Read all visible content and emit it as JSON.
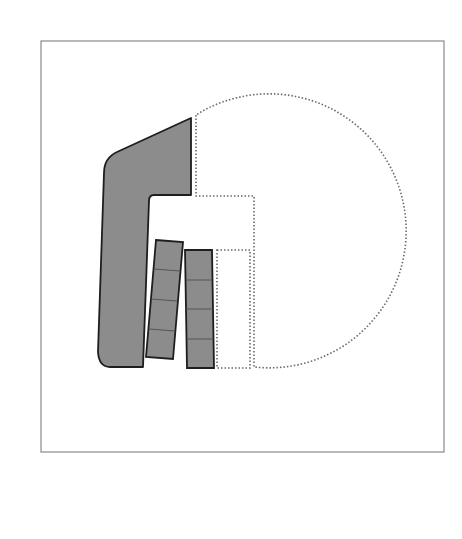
{
  "diagram": {
    "title": "",
    "colors": {
      "background": "#ffffff",
      "frame": "#8a8a8a",
      "fill": "#8c8c8c",
      "outline": "#1e1e1e",
      "divider": "#555555",
      "dotted": "#6a6a6a"
    },
    "frame": {
      "x": 41,
      "y": 41,
      "width": 403,
      "height": 411
    },
    "main_building": {
      "label": "L-shaped building mass",
      "path": "M 191 118 L 191 195 L 154 195 Q 149 195 149 201 L 143 367 L 110 367 Q 99 367 98 352 L 104 173 Q 104 158 117 152 Z"
    },
    "bar_blocks": [
      {
        "label": "Tilted bar block",
        "points": "156,240 183,242 173,359 146,357",
        "dividers": [
          {
            "x1": 154,
            "y1": 269,
            "x2": 180,
            "y2": 271
          },
          {
            "x1": 151,
            "y1": 299,
            "x2": 177,
            "y2": 301
          },
          {
            "x1": 149,
            "y1": 329,
            "x2": 175,
            "y2": 331
          }
        ]
      },
      {
        "label": "Upright bar block",
        "points": "185,250 212,250 214,368 187,368",
        "dividers": [
          {
            "x1": 186,
            "y1": 280,
            "x2": 212,
            "y2": 280
          },
          {
            "x1": 186,
            "y1": 309,
            "x2": 213,
            "y2": 309
          },
          {
            "x1": 187,
            "y1": 339,
            "x2": 213,
            "y2": 339
          }
        ]
      }
    ],
    "dotted_outlines": {
      "circle_zone": {
        "label": "Circular dotted zone",
        "path": "M 196 115 L 196 196 L 254 196 L 254 367 A 137 137 0 1 0 196 115 Z"
      },
      "inner_rect": {
        "label": "Inner dotted rectangle",
        "x": 217,
        "y": 250,
        "width": 33,
        "height": 118
      }
    }
  }
}
